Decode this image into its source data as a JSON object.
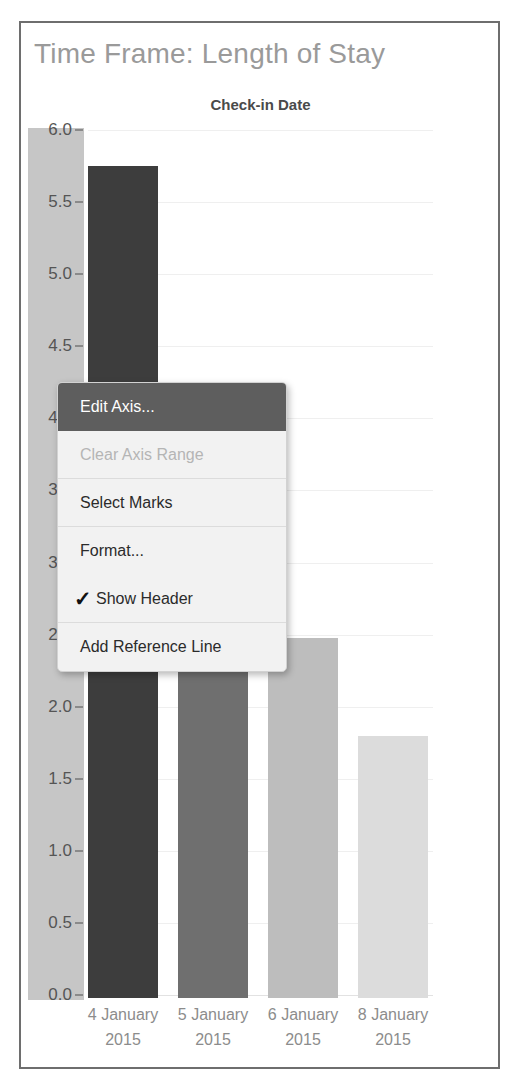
{
  "worksheet": {
    "title": "Time Frame: Length of Stay",
    "column_header": "Check-in Date"
  },
  "chart_data": {
    "type": "bar",
    "title": "Time Frame: Length of Stay",
    "xlabel": "Check-in Date",
    "ylabel": "",
    "categories": [
      "4 January 2015",
      "5 January 2015",
      "6 January 2015",
      "8 January 2015"
    ],
    "category_lines": [
      {
        "line1": "4 January",
        "line2": "2015"
      },
      {
        "line1": "5 January",
        "line2": "2015"
      },
      {
        "line1": "6 January",
        "line2": "2015"
      },
      {
        "line1": "8 January",
        "line2": "2015"
      }
    ],
    "values": [
      5.77,
      3.0,
      2.5,
      1.82
    ],
    "bar_colors": [
      "#3d3d3d",
      "#6f6f6f",
      "#bdbdbd",
      "#dcdcdc"
    ],
    "ylim": [
      0,
      6.0
    ],
    "yticks": [
      "0.0",
      "0.5",
      "1.0",
      "1.5",
      "2.0",
      "2.5",
      "3.0",
      "3.5",
      "4.0",
      "4.5",
      "5.0",
      "5.5",
      "6.0"
    ],
    "ytick_values": [
      0.0,
      0.5,
      1.0,
      1.5,
      2.0,
      2.5,
      3.0,
      3.5,
      4.0,
      4.5,
      5.0,
      5.5,
      6.0
    ],
    "grid": true,
    "legend": "none",
    "axis_selected": true
  },
  "context_menu": {
    "items": [
      {
        "label": "Edit Axis...",
        "state": "selected",
        "checked": false,
        "separator_below": false
      },
      {
        "label": "Clear Axis Range",
        "state": "disabled",
        "checked": false,
        "separator_below": true
      },
      {
        "label": "Select Marks",
        "state": "normal",
        "checked": false,
        "separator_below": true
      },
      {
        "label": "Format...",
        "state": "normal",
        "checked": false,
        "separator_below": false
      },
      {
        "label": "Show Header",
        "state": "normal",
        "checked": true,
        "separator_below": true
      },
      {
        "label": "Add Reference Line",
        "state": "normal",
        "checked": false,
        "separator_below": false
      }
    ],
    "check_glyph": "✓"
  },
  "colors": {
    "frame_border": "#6e6e6e",
    "title_text": "#9a9a9a",
    "axis_band": "#c6c6c6",
    "menu_highlight": "#5e5e5e",
    "menu_background": "#f2f2f2"
  }
}
